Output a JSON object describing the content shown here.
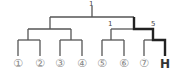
{
  "diagram": {
    "type": "tree",
    "node_labels": {
      "root": "1",
      "right_left": "1",
      "right_right": "5"
    },
    "leaves": [
      {
        "label": "①",
        "x": 18
      },
      {
        "label": "②",
        "x": 40
      },
      {
        "label": "③",
        "x": 60
      },
      {
        "label": "④",
        "x": 82
      },
      {
        "label": "⑤",
        "x": 102
      },
      {
        "label": "⑥",
        "x": 124
      },
      {
        "label": "⑦",
        "x": 144
      },
      {
        "label": "H",
        "x": 165,
        "highlighted": true
      }
    ],
    "highlighted_path": [
      "root",
      "right",
      "right_right",
      "H"
    ],
    "colors": {
      "line": "#555555",
      "highlight": "#222222",
      "leaf_text": "#888888"
    }
  }
}
